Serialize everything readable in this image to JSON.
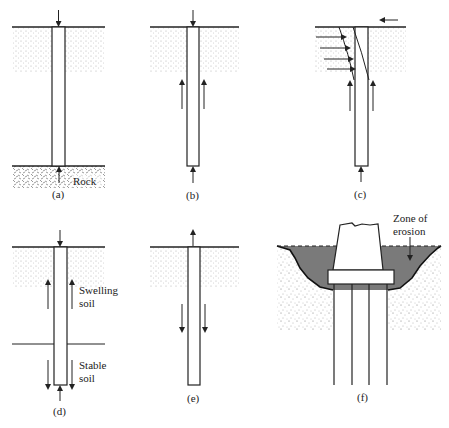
{
  "figure": {
    "panels": [
      {
        "id": "a",
        "caption": "(a)",
        "labels": [
          "Rock"
        ],
        "description": "End-bearing pile through soil resting on rock; load down at head, reaction up at rock"
      },
      {
        "id": "b",
        "caption": "(b)",
        "labels": [],
        "description": "Friction pile; load down at head, upward skin friction along shaft, tip reaction"
      },
      {
        "id": "c",
        "caption": "(c)",
        "labels": [],
        "description": "Laterally loaded pile; horizontal load at head, soil pressure arrows, deflected shape"
      },
      {
        "id": "d",
        "caption": "(d)",
        "labels": [
          "Swelling",
          "soil",
          "Stable",
          "soil"
        ],
        "description": "Pile in swelling soil over stable soil; uplift in swelling zone, downward resistance in stable zone"
      },
      {
        "id": "e",
        "caption": "(e)",
        "labels": [],
        "description": "Uplift (tension) pile; upward pull at head, downward skin friction"
      },
      {
        "id": "f",
        "caption": "(f)",
        "labels": [
          "Zone of",
          "erosion"
        ],
        "description": "Pier on pile group with pile cap; scour zone shaded"
      }
    ]
  },
  "colors": {
    "ink": "#222222",
    "erosion_fill": "#7a7a7a",
    "soil_dots": "#555555"
  }
}
